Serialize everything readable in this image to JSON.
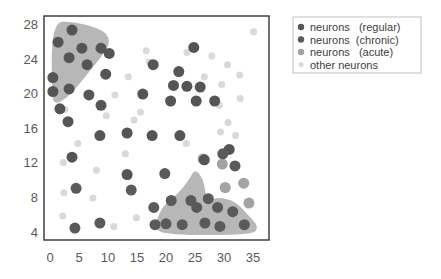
{
  "chart_data": {
    "type": "scatter",
    "title": "",
    "xlabel": "",
    "ylabel": "",
    "xlim": [
      0,
      37
    ],
    "ylim": [
      3,
      29
    ],
    "x_ticks": [
      0,
      5,
      10,
      15,
      20,
      25,
      30,
      35
    ],
    "y_ticks": [
      4,
      8,
      12,
      16,
      20,
      24,
      28
    ],
    "grid": false,
    "legend_position": "right",
    "legend": [
      {
        "label": "neurons   (regular)",
        "color": "#555555"
      },
      {
        "label": "neurons  (chronic)",
        "color": "#5a5a5a"
      },
      {
        "label": "neurons   (acute)",
        "color": "#a3a3a3"
      },
      {
        "label": "other neurons",
        "color": "#d9d9d9"
      }
    ],
    "regions": [
      {
        "name": "top-left cluster",
        "color": "#aaaaaa",
        "points": [
          [
            0.3,
            28.2
          ],
          [
            4,
            28.3
          ],
          [
            9.5,
            27.3
          ],
          [
            10.5,
            25.7
          ],
          [
            8,
            23.5
          ],
          [
            5,
            21
          ],
          [
            3,
            19.5
          ],
          [
            1,
            18.7
          ],
          [
            0.3,
            19.5
          ]
        ]
      },
      {
        "name": "bottom-right cluster",
        "color": "#aaaaaa",
        "points": [
          [
            18.5,
            5.5
          ],
          [
            19.5,
            7
          ],
          [
            22,
            8.3
          ],
          [
            24,
            10
          ],
          [
            25,
            11.3
          ],
          [
            26.5,
            10
          ],
          [
            27,
            7.5
          ],
          [
            29,
            8
          ],
          [
            32,
            7.5
          ],
          [
            34,
            6
          ],
          [
            36,
            4.6
          ],
          [
            35,
            3.6
          ],
          [
            20,
            3.6
          ],
          [
            17.8,
            4.5
          ]
        ]
      }
    ],
    "series": [
      {
        "name": "neurons (regular)",
        "color": "#555555",
        "radius": 5.5,
        "points": [
          [
            3.8,
            27.3
          ],
          [
            1.4,
            25.9
          ],
          [
            5.5,
            25.2
          ],
          [
            8.8,
            25.2
          ],
          [
            3.3,
            24.1
          ],
          [
            6.4,
            23.3
          ],
          [
            0.5,
            21.8
          ],
          [
            9.6,
            22.2
          ],
          [
            0.5,
            20.2
          ],
          [
            3.3,
            20.5
          ],
          [
            6.7,
            19.8
          ],
          [
            8.8,
            18.6
          ],
          [
            1.7,
            18.2
          ],
          [
            3.1,
            16.7
          ],
          [
            8.6,
            15.1
          ],
          [
            13.3,
            15.4
          ],
          [
            3.8,
            12.6
          ],
          [
            13.3,
            10.6
          ],
          [
            10.2,
            24.6
          ],
          [
            17.8,
            23.3
          ],
          [
            22.2,
            22.5
          ],
          [
            24.8,
            25.3
          ],
          [
            21.3,
            20.9
          ],
          [
            16,
            19.9
          ],
          [
            20.8,
            19.1
          ],
          [
            23.6,
            20.8
          ],
          [
            25.9,
            20.7
          ],
          [
            25.2,
            19.1
          ],
          [
            28.4,
            19.1
          ],
          [
            17.6,
            15.1
          ],
          [
            22.4,
            15.1
          ],
          [
            30.9,
            13.5
          ],
          [
            26.6,
            12.3
          ]
        ]
      },
      {
        "name": "neurons (chronic)",
        "color": "#5a5a5a",
        "radius": 5.5,
        "points": [
          [
            4.5,
            9.0
          ],
          [
            4.3,
            4.4
          ],
          [
            8.6,
            5.0
          ],
          [
            14,
            8.8
          ],
          [
            19.8,
            10.7
          ],
          [
            29.8,
            13.0
          ],
          [
            31.9,
            11.6
          ],
          [
            20.9,
            7.6
          ],
          [
            24.3,
            7.6
          ],
          [
            27.3,
            7.8
          ],
          [
            18.1,
            4.8
          ],
          [
            22.8,
            4.8
          ],
          [
            26.7,
            5.0
          ],
          [
            29.3,
            4.6
          ],
          [
            17.9,
            6.8
          ],
          [
            25.3,
            6.8
          ],
          [
            33.5,
            4.8
          ],
          [
            20,
            4.9
          ],
          [
            28.9,
            6.8
          ],
          [
            31.5,
            6.3
          ]
        ]
      },
      {
        "name": "neurons (acute)",
        "color": "#a3a3a3",
        "radius": 5.5,
        "points": [
          [
            26.4,
            12.4
          ],
          [
            29.7,
            11.8
          ],
          [
            30.2,
            9.1
          ],
          [
            33.4,
            9.6
          ],
          [
            34.3,
            7.3
          ]
        ]
      },
      {
        "name": "other neurons",
        "color": "#d9d9d9",
        "radius": 3.5,
        "points": [
          [
            11.2,
            19.8
          ],
          [
            2.6,
            18.1
          ],
          [
            9.7,
            17.4
          ],
          [
            4.8,
            14.2
          ],
          [
            13,
            13
          ],
          [
            2.3,
            12
          ],
          [
            8,
            11.1
          ],
          [
            13.5,
            10.3
          ],
          [
            2.4,
            8.5
          ],
          [
            7.4,
            7.9
          ],
          [
            2.2,
            5.8
          ],
          [
            11,
            4.6
          ],
          [
            14.9,
            5.6
          ],
          [
            16.6,
            24.9
          ],
          [
            23.6,
            24.7
          ],
          [
            27.9,
            24.3
          ],
          [
            35.1,
            27.1
          ],
          [
            17.1,
            23.6
          ],
          [
            13.5,
            21.9
          ],
          [
            30.6,
            23.3
          ],
          [
            26.6,
            21.9
          ],
          [
            29.6,
            21.0
          ],
          [
            32.7,
            22.1
          ],
          [
            29.2,
            18.6
          ],
          [
            32.8,
            19.4
          ],
          [
            15.6,
            17.8
          ],
          [
            14.5,
            16.9
          ],
          [
            30.7,
            16.6
          ],
          [
            29.4,
            15.5
          ],
          [
            32,
            15.1
          ],
          [
            23.5,
            14.2
          ]
        ]
      }
    ]
  }
}
